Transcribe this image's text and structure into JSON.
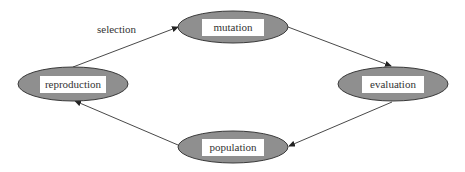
{
  "diagram": {
    "type": "cycle",
    "colors": {
      "ellipse_fill": "#8f8f8f",
      "ellipse_stroke": "#3a3a3a",
      "label_box": "#ffffff",
      "edge": "#333333",
      "text": "#333333"
    },
    "nodes": [
      {
        "id": "mutation",
        "label": "mutation"
      },
      {
        "id": "evaluation",
        "label": "evaluation"
      },
      {
        "id": "population",
        "label": "population"
      },
      {
        "id": "reproduction",
        "label": "reproduction"
      }
    ],
    "edges": [
      {
        "from": "reproduction",
        "to": "mutation",
        "label": "selection"
      },
      {
        "from": "mutation",
        "to": "evaluation",
        "label": ""
      },
      {
        "from": "evaluation",
        "to": "population",
        "label": ""
      },
      {
        "from": "population",
        "to": "reproduction",
        "label": ""
      }
    ]
  }
}
